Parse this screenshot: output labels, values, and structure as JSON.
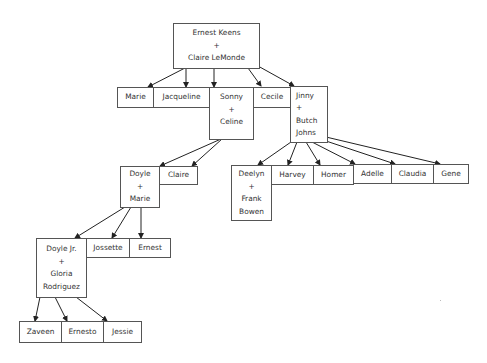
{
  "diagram": {
    "type": "family-tree",
    "nodes": {
      "root": {
        "lines": [
          "Ernest Keens",
          "+",
          "Claire LeMonde"
        ]
      },
      "marie": {
        "lines": [
          "Marie"
        ]
      },
      "jacqueline": {
        "lines": [
          "Jacqueline"
        ]
      },
      "sonny": {
        "lines": [
          "Sonny",
          "+",
          "Celine"
        ]
      },
      "cecile": {
        "lines": [
          "Cecile"
        ]
      },
      "jinny": {
        "lines": [
          "Jinny",
          "+",
          "Butch",
          "Johns"
        ]
      },
      "doyle": {
        "lines": [
          "Doyle",
          "+",
          "Marie"
        ]
      },
      "claire": {
        "lines": [
          "Claire"
        ]
      },
      "deelyn": {
        "lines": [
          "Deelyn",
          "+",
          "Frank",
          "Bowen"
        ]
      },
      "harvey": {
        "lines": [
          "Harvey"
        ]
      },
      "homer": {
        "lines": [
          "Homer"
        ]
      },
      "adelle": {
        "lines": [
          "Adelle"
        ]
      },
      "claudia": {
        "lines": [
          "Claudia"
        ]
      },
      "gene": {
        "lines": [
          "Gene"
        ]
      },
      "doylejr": {
        "lines": [
          "Doyle Jr.",
          "+",
          "Gloria",
          "Rodriguez"
        ]
      },
      "jossette": {
        "lines": [
          "Jossette"
        ]
      },
      "ernest": {
        "lines": [
          "Ernest"
        ]
      },
      "zaveen": {
        "lines": [
          "Zaveen"
        ]
      },
      "ernesto": {
        "lines": [
          "Ernesto"
        ]
      },
      "jessie": {
        "lines": [
          "Jessie"
        ]
      }
    },
    "edges": [
      [
        "root",
        "marie"
      ],
      [
        "root",
        "jacqueline"
      ],
      [
        "root",
        "sonny"
      ],
      [
        "root",
        "cecile"
      ],
      [
        "root",
        "jinny"
      ],
      [
        "sonny",
        "doyle"
      ],
      [
        "sonny",
        "claire"
      ],
      [
        "jinny",
        "deelyn"
      ],
      [
        "jinny",
        "harvey"
      ],
      [
        "jinny",
        "homer"
      ],
      [
        "jinny",
        "adelle"
      ],
      [
        "jinny",
        "claudia"
      ],
      [
        "jinny",
        "gene"
      ],
      [
        "doyle",
        "doylejr"
      ],
      [
        "doyle",
        "jossette"
      ],
      [
        "doyle",
        "ernest"
      ],
      [
        "doylejr",
        "zaveen"
      ],
      [
        "doylejr",
        "ernesto"
      ],
      [
        "doylejr",
        "jessie"
      ]
    ],
    "colors": {
      "border": "#555555",
      "text": "#333333",
      "arrow": "#222222",
      "background": "#ffffff"
    }
  }
}
